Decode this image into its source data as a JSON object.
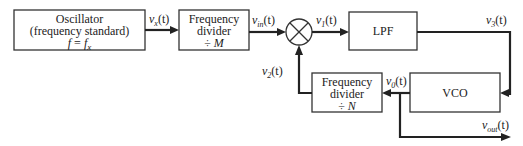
{
  "blocks": {
    "oscillator": {
      "lines": [
        "Oscillator",
        "(frequency standard)",
        "f = f_x"
      ]
    },
    "divider_m": {
      "lines": [
        "Frequency",
        "divider",
        "÷ M"
      ]
    },
    "mixer": {
      "symbol": "multiplier-icon"
    },
    "lpf": {
      "lines": [
        "LPF"
      ]
    },
    "vco": {
      "lines": [
        "VCO"
      ]
    },
    "divider_n": {
      "lines": [
        "Frequency",
        "divider",
        "÷ N"
      ]
    }
  },
  "signals": {
    "vx": "v_x(t)",
    "vin": "v_in(t)",
    "v1": "v_1(t)",
    "v3": "v_3(t)",
    "v0": "v_0(t)",
    "v2": "v_2(t)",
    "vout": "v_out(t)"
  },
  "display": {
    "osc_l1": "Oscillator",
    "osc_l2": "(frequency standard)",
    "osc_l3a": "f",
    "osc_l3b": " = ",
    "osc_l3c": "f",
    "osc_l3d": "x",
    "divm_l1": "Frequency",
    "divm_l2": "divider",
    "divm_l3a": "÷ ",
    "divm_l3b": "M",
    "divn_l1": "Frequency",
    "divn_l2": "divider",
    "divn_l3a": "÷ ",
    "divn_l3b": "N",
    "lpf": "LPF",
    "vco": "VCO",
    "v": "v",
    "t": "(t)",
    "sub_x": "x",
    "sub_in": "in",
    "sub_1": "1",
    "sub_3": "3",
    "sub_0": "0",
    "sub_2": "2",
    "sub_out": "out"
  }
}
